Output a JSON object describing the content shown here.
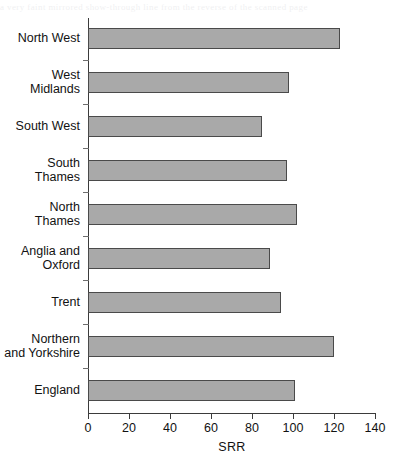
{
  "page": {
    "bleed_text": "a very faint mirrored show-through line from the reverse of the scanned page"
  },
  "chart_data": {
    "type": "bar",
    "orientation": "horizontal",
    "title": "",
    "subtitle": "",
    "xlabel": "SRR",
    "ylabel": "",
    "categories": [
      "North West",
      "West Midlands",
      "South West",
      "South Thames",
      "North Thames",
      "Anglia and Oxford",
      "Trent",
      "Northern and Yorkshire",
      "England"
    ],
    "category_lines": [
      [
        "North West"
      ],
      [
        "West",
        "Midlands"
      ],
      [
        "South West"
      ],
      [
        "South",
        "Thames"
      ],
      [
        "North",
        "Thames"
      ],
      [
        "Anglia and",
        "Oxford"
      ],
      [
        "Trent"
      ],
      [
        "Northern",
        "and Yorkshire"
      ],
      [
        "England"
      ]
    ],
    "values": [
      123,
      98,
      85,
      97,
      102,
      89,
      94,
      120,
      101
    ],
    "xlim": [
      0,
      140
    ],
    "xticks": [
      0,
      20,
      40,
      60,
      80,
      100,
      120,
      140
    ],
    "xticklabels": [
      "0",
      "20",
      "40",
      "60",
      "80",
      "100",
      "120",
      "140"
    ],
    "grid": false,
    "legend": null,
    "legend_position": "none",
    "bar_fill_color": "#a9a9a9",
    "bar_edge_color": "#4a4a4a",
    "axis_color": "#3b3b3b"
  }
}
